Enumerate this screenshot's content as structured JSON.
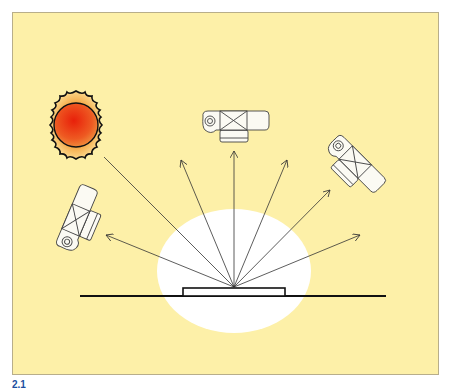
{
  "diagram": {
    "background_color": "#fdf0a8",
    "highlight_color": "#ffffff",
    "elements": [
      {
        "name": "sun",
        "icon": "sun-icon",
        "color_inner": "#e8300e",
        "color_outer": "#f6b24a"
      },
      {
        "name": "camera-top",
        "icon": "camera-icon"
      },
      {
        "name": "camera-right",
        "icon": "camera-icon"
      },
      {
        "name": "camera-left",
        "icon": "camera-icon"
      },
      {
        "name": "sample-object",
        "shape": "flat rectangle on surface"
      },
      {
        "name": "ground-line"
      }
    ],
    "rays": 7
  },
  "caption": {
    "label": "2.1"
  }
}
